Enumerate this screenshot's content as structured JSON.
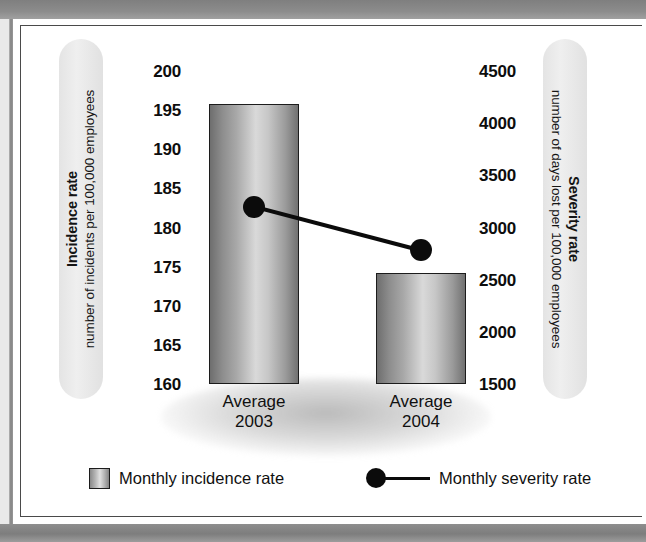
{
  "chart_data": {
    "type": "bar",
    "title": "",
    "categories": [
      "Average\n2003",
      "Average\n2004"
    ],
    "category_lines": [
      [
        "Average",
        "2003"
      ],
      [
        "Average",
        "2004"
      ]
    ],
    "series": [
      {
        "name": "Monthly incidence rate",
        "type": "bar",
        "axis": "left",
        "values": [
          195.8,
          174.2
        ]
      },
      {
        "name": "Monthly severity rate",
        "type": "line",
        "axis": "right",
        "values": [
          3200,
          2780
        ]
      }
    ],
    "left_axis": {
      "title_bold": "Incidence rate",
      "title_sub": "number of incidents per 100,000 employees",
      "ticks": [
        200,
        195,
        190,
        185,
        180,
        175,
        170,
        165,
        160
      ],
      "tick_labels": [
        "200",
        "195",
        "190",
        "185",
        "180",
        "175",
        "170",
        "165",
        "160"
      ],
      "ylim": [
        160,
        200
      ]
    },
    "right_axis": {
      "title_bold": "Severity rate",
      "title_sub": "number of days lost per 100,000 employees",
      "ticks": [
        4500,
        4000,
        3500,
        3000,
        2500,
        2000,
        1500
      ],
      "tick_labels": [
        "4500",
        "4000",
        "3500",
        "3000",
        "2500",
        "2000",
        "1500"
      ],
      "ylim": [
        1500,
        4500
      ]
    },
    "xlabel": "",
    "grid": false,
    "legend_position": "bottom",
    "legend": [
      {
        "label": "Monthly incidence rate",
        "marker": "bar-swatch"
      },
      {
        "label": "Monthly severity rate",
        "marker": "dot-line"
      }
    ]
  },
  "colors": {
    "frame_band": "#8a8a8a",
    "panel_background": "#ffffff",
    "panel_border": "#4a4a4a",
    "bar_outline": "#1c1c1c",
    "marker": "#0b0b0b",
    "axis_pill": "#e7e7e7",
    "text": "#101010"
  },
  "icons": {
    "legend_bar_swatch": "bar-swatch-icon",
    "legend_marker": "dot-line-icon"
  }
}
